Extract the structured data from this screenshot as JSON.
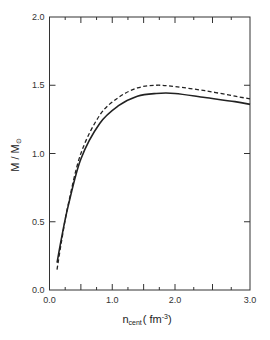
{
  "chart_data": {
    "type": "line",
    "title": "",
    "xlabel": "n_cent ( fm^-3 )",
    "xlabel_main": "n",
    "xlabel_sub": "cent",
    "xlabel_unit": "( fm",
    "xlabel_exp": "-3",
    "xlabel_close": ")",
    "ylabel": "M / M_⊙",
    "ylabel_main": "M / M",
    "ylabel_sub": "⊙",
    "xlim": [
      0.0,
      3.0
    ],
    "ylim": [
      0.0,
      2.0
    ],
    "x_ticks": [
      "0.0",
      "1.0",
      "2.0",
      "3.0"
    ],
    "y_ticks": [
      "0.0",
      "0.5",
      "1.0",
      "1.5",
      "2.0"
    ],
    "grid": false,
    "legend": null,
    "series": [
      {
        "name": "solid",
        "style": "solid",
        "x": [
          0.12,
          0.2,
          0.3,
          0.5,
          0.8,
          1.1,
          1.4,
          1.7,
          2.0,
          2.4,
          2.8,
          3.0
        ],
        "y": [
          0.2,
          0.4,
          0.62,
          0.96,
          1.22,
          1.35,
          1.42,
          1.44,
          1.44,
          1.41,
          1.38,
          1.36
        ]
      },
      {
        "name": "dashed",
        "style": "dashed",
        "x": [
          0.12,
          0.2,
          0.3,
          0.5,
          0.8,
          1.1,
          1.4,
          1.7,
          2.0,
          2.4,
          2.8,
          3.0
        ],
        "y": [
          0.15,
          0.38,
          0.63,
          1.0,
          1.28,
          1.41,
          1.48,
          1.5,
          1.49,
          1.46,
          1.42,
          1.4
        ]
      }
    ]
  }
}
